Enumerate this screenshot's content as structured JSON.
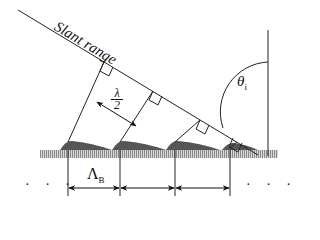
{
  "diagram": {
    "labels": {
      "slant_range": "Slant range",
      "theta": "θ",
      "theta_sub": "i",
      "lambda_num": "λ",
      "lambda_den": "2",
      "period": "Λ",
      "period_sub": "B",
      "dots_left": "· · ·",
      "dots_right": "· · ·"
    },
    "colors": {
      "line": "#222222",
      "ground": "#7a7a7a",
      "background": "#ffffff"
    },
    "periods_shown": 3
  }
}
